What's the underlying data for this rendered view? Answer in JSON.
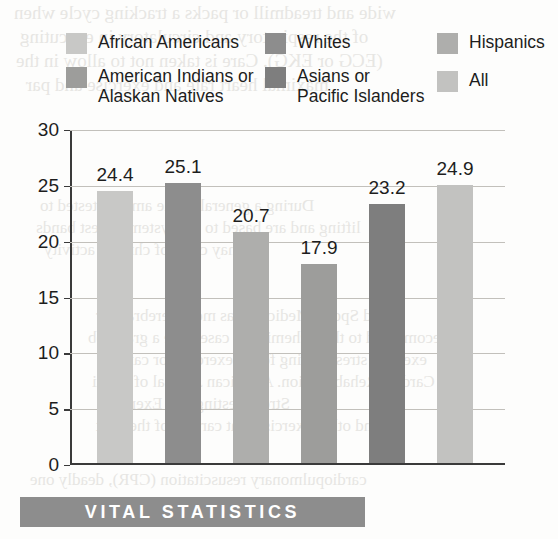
{
  "chart_data": {
    "type": "bar",
    "title": "",
    "subtitle": "",
    "xlabel": "",
    "ylabel": "",
    "ylim": [
      0,
      30
    ],
    "ytick_step": 5,
    "yticks": [
      "30",
      "25",
      "20",
      "15",
      "10",
      "5",
      "0"
    ],
    "grid": "horizontal",
    "legend_position": "above-plot",
    "legend_columns": 3,
    "categories": [
      "African Americans",
      "Whites",
      "Hispanics",
      "American Indians or\nAlaskan Natives",
      "Asians or\nPacific Islanders",
      "All"
    ],
    "values": [
      24.4,
      25.1,
      20.7,
      17.9,
      23.2,
      24.9
    ],
    "value_labels": [
      "24.4",
      "25.1",
      "20.7",
      "17.9",
      "23.2",
      "24.9"
    ],
    "bar_colors": [
      "#c8c8c6",
      "#8d8d8d",
      "#aeaeac",
      "#9d9d9b",
      "#7e7e7e",
      "#c2c2c0"
    ],
    "annotations": []
  },
  "legend": {
    "items": [
      {
        "label": "African Americans",
        "color": "#c8c8c6"
      },
      {
        "label": "Whites",
        "color": "#8d8d8d"
      },
      {
        "label": "Hispanics",
        "color": "#aeaeac"
      },
      {
        "label": "American Indians or\nAlaskan Natives",
        "color": "#9d9d9b"
      },
      {
        "label": "Asians or\nPacific Islanders",
        "color": "#7e7e7e"
      },
      {
        "label": "All",
        "color": "#c2c2c0"
      }
    ]
  },
  "banner": {
    "text": "VITAL STATISTICS",
    "background": "#8d8d8d",
    "color": "#ffffff"
  },
  "page_bleed": {
    "lines": [
      "wide and treadmill or packs a tracking cycle when",
      "of the respiratory and circulatory in executing",
      "(ECG or EKG). Care is taken not to allow in the",
      "maximal heart rate and exercise and par",
      "During a general of the amount tested to",
      "lifting and are based to the system lowest bands",
      "may carry of chronic activity",
      "and Sports Medicine has more cerebral cor",
      "recommend to the ischemic the case have a graph ob",
      "exercise stress testing for of exercise for cardiac",
      "Cardiac Rehabilitation. American Journal of Cardi",
      "Stress Testing and Exercise",
      "and other exercise that cardiac of the next",
      "Cardiac Rehabilitation. American and to health program",
      "cardiopulmonary resuscitation (CPR), deadly one",
      "and can be performed by a bystander"
    ]
  }
}
